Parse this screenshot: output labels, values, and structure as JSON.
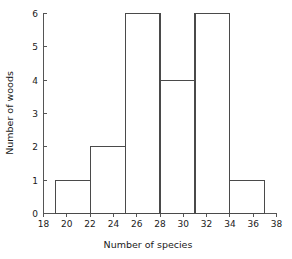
{
  "chart_data": {
    "type": "bar",
    "title": "",
    "subtitle": "",
    "xlabel": "Number of species",
    "ylabel": "Number of woods",
    "xlim": [
      18,
      38
    ],
    "ylim": [
      0,
      6
    ],
    "grid": false,
    "legend": null,
    "bin_width": 3,
    "bin_edges": [
      19,
      22,
      25,
      28,
      31,
      34,
      37
    ],
    "categories": [
      "19-22",
      "22-25",
      "25-28",
      "28-31",
      "31-34",
      "34-37"
    ],
    "values": [
      1,
      2,
      6,
      4,
      6,
      1
    ],
    "bars": [
      {
        "start": 19,
        "end": 22,
        "count": 1
      },
      {
        "start": 22,
        "end": 25,
        "count": 2
      },
      {
        "start": 25,
        "end": 28,
        "count": 6
      },
      {
        "start": 28,
        "end": 31,
        "count": 4
      },
      {
        "start": 31,
        "end": 34,
        "count": 6
      },
      {
        "start": 34,
        "end": 37,
        "count": 1
      }
    ],
    "xticks": [
      18,
      20,
      22,
      24,
      26,
      28,
      30,
      32,
      34,
      36,
      38
    ],
    "xtick_labels": [
      "18",
      "20",
      "22",
      "24",
      "26",
      "28",
      "30",
      "32",
      "34",
      "36",
      "38"
    ],
    "yticks": [
      0,
      1,
      2,
      3,
      4,
      5,
      6
    ],
    "ytick_labels": [
      "0",
      "1",
      "2",
      "3",
      "4",
      "5",
      "6"
    ],
    "colors": {
      "bar_stroke": "#4a4a4a",
      "bar_fill": "none",
      "axis": "#555555",
      "text": "#1a1a1a",
      "background": "#ffffff"
    }
  }
}
